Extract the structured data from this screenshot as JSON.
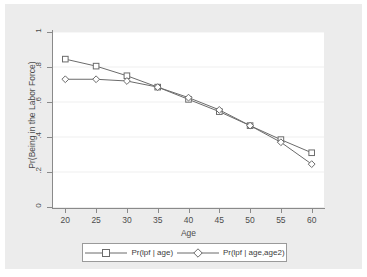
{
  "chart_data": {
    "type": "line",
    "title": "",
    "xlabel": "Age",
    "ylabel": "Pr(Being in the Labor Force)",
    "x": [
      20,
      25,
      30,
      35,
      40,
      45,
      50,
      55,
      60
    ],
    "xlim": [
      18,
      62
    ],
    "ylim": [
      0,
      1
    ],
    "xticks": [
      "20",
      "25",
      "30",
      "35",
      "40",
      "45",
      "50",
      "55",
      "60"
    ],
    "yticks": [
      "0",
      ".2",
      ".4",
      ".6",
      ".8",
      "1"
    ],
    "ytick_values": [
      0,
      0.2,
      0.4,
      0.6,
      0.8,
      1
    ],
    "grid": "horizontal",
    "legend_position": "below",
    "series": [
      {
        "name": "Pr(lpf | age)",
        "marker": "square",
        "color": "#6b6b6b",
        "values": [
          0.845,
          0.805,
          0.75,
          0.685,
          0.615,
          0.545,
          0.465,
          0.385,
          0.31
        ]
      },
      {
        "name": "Pr(lpf | age,age2)",
        "marker": "diamond",
        "color": "#6b6b6b",
        "values": [
          0.73,
          0.73,
          0.72,
          0.685,
          0.625,
          0.555,
          0.465,
          0.37,
          0.245
        ]
      }
    ]
  },
  "axes": {
    "x_title": "Age",
    "y_title": "Pr(Being in the Labor Force)"
  },
  "legend": {
    "entries": [
      {
        "label": "Pr(lpf | age)",
        "marker": "square-marker"
      },
      {
        "label": "Pr(lpf | age,age2)",
        "marker": "diamond-marker"
      }
    ]
  },
  "colors": {
    "figure_background": "#ececec",
    "plot_background": "#ffffff",
    "axis": "#8a8a8a",
    "grid": "#efefef",
    "series": "#6b6b6b",
    "text": "#4d4d4d"
  }
}
